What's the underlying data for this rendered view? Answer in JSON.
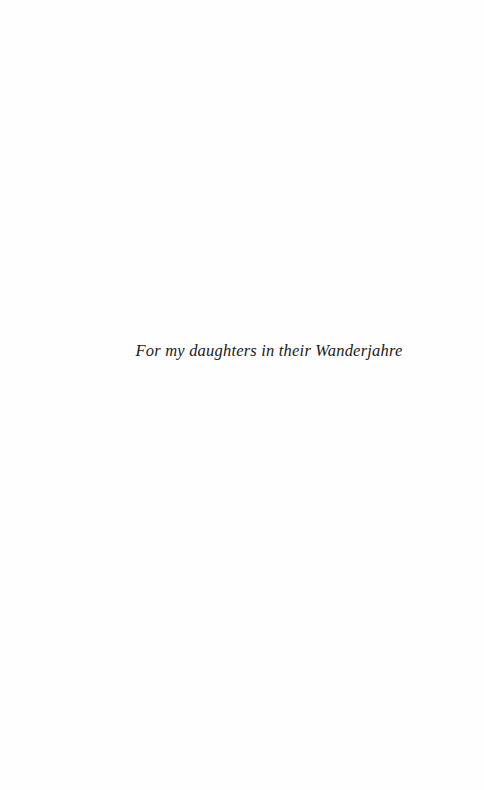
{
  "page": {
    "type": "dedication",
    "background": "#fefefe",
    "text_color": "#1a1a1a"
  },
  "dedication": {
    "text": "For my daughters in their Wanderjahre"
  }
}
